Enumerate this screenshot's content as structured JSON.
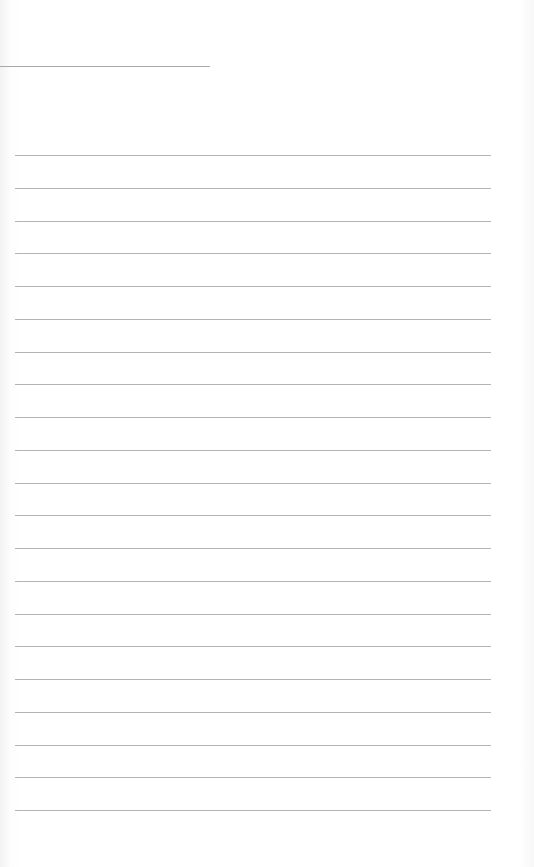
{
  "page": {
    "type": "blank lined paper",
    "header_rule": {
      "x": 0,
      "y": 66,
      "width": 210
    },
    "ruled_lines": {
      "count": 21,
      "first_y": 155,
      "spacing": 32.75,
      "x_start": 15,
      "x_end": 491
    },
    "colors": {
      "paper": "#ffffff",
      "rule": "#b4b4b4"
    }
  }
}
